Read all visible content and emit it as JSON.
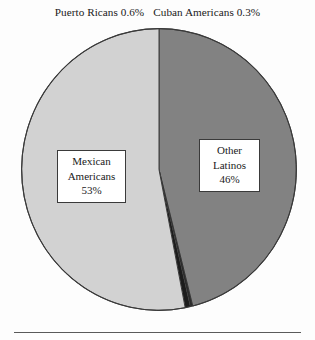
{
  "chart_data": {
    "type": "pie",
    "title": "",
    "subtitle": "",
    "xlabel": "",
    "ylabel": "",
    "legend_position": "none",
    "grid": false,
    "start_angle_deg": 0,
    "direction": "clockwise",
    "categories": [
      "Other Latinos",
      "Cuban Americans",
      "Puerto Ricans",
      "Mexican Americans"
    ],
    "values": [
      46,
      0.3,
      0.6,
      53
    ],
    "slices": [
      {
        "label": "Other Latinos",
        "value": 46,
        "value_label": "46%",
        "color": "#828282",
        "label_placement": "inside-box",
        "label_lines": [
          "Other",
          "Latinos",
          "46%"
        ]
      },
      {
        "label": "Cuban Americans",
        "value": 0.3,
        "value_label": "0.3%",
        "color": "#2b2b2b",
        "label_placement": "above-chart",
        "label_text": "Cuban Americans 0.3%"
      },
      {
        "label": "Puerto Ricans",
        "value": 0.6,
        "value_label": "0.6%",
        "color": "#1c1c1c",
        "label_placement": "above-chart",
        "label_text": "Puerto Ricans 0.6%"
      },
      {
        "label": "Mexican Americans",
        "value": 53,
        "value_label": "53%",
        "color": "#d2d2d2",
        "label_placement": "inside-box",
        "label_lines": [
          "Mexican",
          "Americans",
          "53%"
        ]
      }
    ]
  },
  "annotations": {
    "puerto_ricans_label": "Puerto Ricans 0.6%",
    "cuban_americans_label": "Cuban Americans 0.3%"
  },
  "callouts": {
    "mexican": {
      "line1": "Mexican",
      "line2": "Americans",
      "line3": "53%"
    },
    "other": {
      "line1": "Other",
      "line2": "Latinos",
      "line3": "46%"
    }
  },
  "style": {
    "background": "#fdfdfd",
    "slice_light": "#d2d2d2",
    "slice_medium": "#828282",
    "slice_dark": "#1c1c1c",
    "outline": "#3a3a3a",
    "rule_color": "#5a5a5a"
  }
}
